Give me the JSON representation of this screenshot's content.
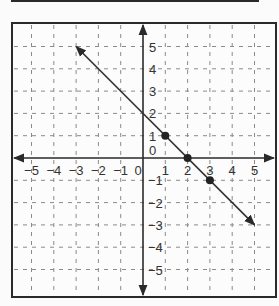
{
  "chart_data": {
    "type": "line",
    "title": "",
    "xlabel": "",
    "ylabel": "",
    "xlim": [
      -5,
      5
    ],
    "ylim": [
      -5,
      5
    ],
    "grid": true,
    "grid_style": "dashed",
    "x_ticks": [
      "-5",
      "-4",
      "-3",
      "-2",
      "-1",
      "0",
      "1",
      "2",
      "3",
      "4",
      "5"
    ],
    "y_ticks": [
      "5",
      "4",
      "3",
      "2",
      "1",
      "0",
      "-1",
      "-2",
      "-3",
      "-4",
      "-5"
    ],
    "series": [
      {
        "name": "line",
        "equation": "y = -x + 2",
        "x": [
          -3,
          5
        ],
        "y": [
          5,
          -3
        ],
        "arrows": "both"
      }
    ],
    "points": [
      {
        "x": 1,
        "y": 1
      },
      {
        "x": 2,
        "y": 0
      },
      {
        "x": 3,
        "y": -1
      }
    ],
    "legend": null
  },
  "colors": {
    "axis": "#2a2a2a",
    "grid": "#8a8a8a",
    "line": "#333333",
    "frame": "#2a2a2a"
  }
}
